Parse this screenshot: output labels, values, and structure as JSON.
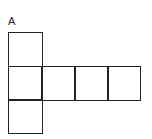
{
  "diagram": {
    "label": "A",
    "line_color": "#222222",
    "cells": [
      {
        "id": "top",
        "x": 8,
        "y": 32,
        "w": 35,
        "h": 35
      },
      {
        "id": "middle-left",
        "x": 8,
        "y": 66,
        "w": 35,
        "h": 35
      },
      {
        "id": "middle-2",
        "x": 41,
        "y": 66,
        "w": 35,
        "h": 35
      },
      {
        "id": "middle-3",
        "x": 74,
        "y": 66,
        "w": 35,
        "h": 35
      },
      {
        "id": "middle-4",
        "x": 107,
        "y": 66,
        "w": 34,
        "h": 35
      },
      {
        "id": "bottom",
        "x": 8,
        "y": 99,
        "w": 35,
        "h": 35
      }
    ]
  }
}
